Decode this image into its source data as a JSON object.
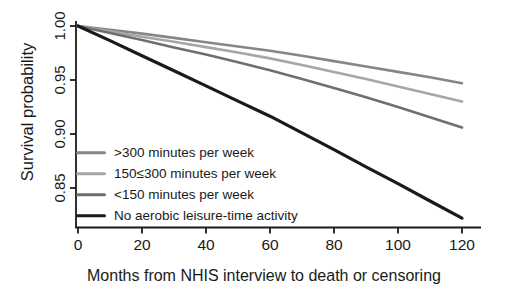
{
  "background": "#ffffff",
  "axis_color": "#1a1a1a",
  "text_color": "#1a1a1a",
  "chart_data": {
    "type": "line",
    "title": "",
    "xlabel": "Months from NHIS interview to death or censoring",
    "ylabel": "Survival probability",
    "xlim": [
      0,
      126
    ],
    "ylim": [
      0.815,
      1.005
    ],
    "grid": false,
    "legend_position": "lower-left",
    "x_ticks": [
      0,
      20,
      40,
      60,
      80,
      100,
      120
    ],
    "y_ticks": [
      1.0,
      0.95,
      0.9,
      0.85
    ],
    "y_tick_labels": [
      "1.00",
      "0.95",
      "0.90",
      "0.85"
    ],
    "x": [
      0,
      10,
      20,
      30,
      40,
      50,
      60,
      70,
      80,
      90,
      100,
      110,
      120
    ],
    "series": [
      {
        "key": "over-300",
        "name": ">300 minutes per week",
        "color": "#868686",
        "values": [
          1.0,
          0.9965,
          0.993,
          0.989,
          0.985,
          0.981,
          0.977,
          0.9725,
          0.9675,
          0.9625,
          0.9575,
          0.9525,
          0.947
        ]
      },
      {
        "key": "150-to-300",
        "name": "150≤300 minutes per week",
        "color": "#a6a6a6",
        "values": [
          1.0,
          0.995,
          0.99,
          0.9855,
          0.9805,
          0.9755,
          0.97,
          0.964,
          0.9575,
          0.951,
          0.944,
          0.937,
          0.93
        ]
      },
      {
        "key": "under-150",
        "name": "<150 minutes per week",
        "color": "#6f6f6f",
        "values": [
          1.0,
          0.9935,
          0.987,
          0.98,
          0.9735,
          0.9665,
          0.959,
          0.951,
          0.9425,
          0.934,
          0.925,
          0.9155,
          0.906
        ]
      },
      {
        "key": "no-activity",
        "name": "No aerobic leisure-time activity",
        "color": "#1a1a1a",
        "values": [
          1.0,
          0.9865,
          0.9725,
          0.9585,
          0.9445,
          0.9305,
          0.9165,
          0.901,
          0.8855,
          0.8695,
          0.854,
          0.838,
          0.822
        ]
      }
    ]
  }
}
